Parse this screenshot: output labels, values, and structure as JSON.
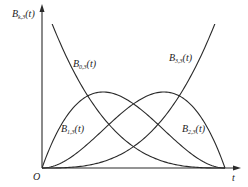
{
  "chart_data": {
    "type": "line",
    "title": "",
    "xlabel": "t",
    "ylabel": "B_{k,3}(t)",
    "origin_label": "O",
    "xlim": [
      0,
      1
    ],
    "ylim": [
      0,
      1
    ],
    "grid": false,
    "legend": "inline labels",
    "series": [
      {
        "name": "B_{0,3}(t)",
        "formula": "(1-t)^3",
        "x": [
          0,
          0.25,
          0.5,
          0.75,
          1
        ],
        "values": [
          1,
          0.422,
          0.125,
          0.016,
          0
        ]
      },
      {
        "name": "B_{1,3}(t)",
        "formula": "3t(1-t)^2",
        "x": [
          0,
          0.25,
          0.333,
          0.5,
          0.75,
          1
        ],
        "values": [
          0,
          0.422,
          0.444,
          0.375,
          0.141,
          0
        ]
      },
      {
        "name": "B_{2,3}(t)",
        "formula": "3t^2(1-t)",
        "x": [
          0,
          0.25,
          0.5,
          0.667,
          0.75,
          1
        ],
        "values": [
          0,
          0.141,
          0.375,
          0.444,
          0.422,
          0
        ]
      },
      {
        "name": "B_{3,3}(t)",
        "formula": "t^3",
        "x": [
          0,
          0.25,
          0.5,
          0.75,
          1
        ],
        "values": [
          0,
          0.016,
          0.125,
          0.422,
          1
        ]
      }
    ]
  },
  "labels": {
    "y_axis": {
      "main": "B",
      "sub": "k,3",
      "arg": "(t)"
    },
    "x_axis": "t",
    "origin": "O",
    "b03": {
      "main": "B",
      "sub": "0,3",
      "arg": "(t)"
    },
    "b13": {
      "main": "B",
      "sub": "1,3",
      "arg": "(t)"
    },
    "b23": {
      "main": "B",
      "sub": "2,3",
      "arg": "(t)"
    },
    "b33": {
      "main": "B",
      "sub": "3,3",
      "arg": "(t)"
    }
  },
  "colors": {
    "line": "#2a2a2a",
    "axis": "#2a2a2a",
    "background": "#ffffff"
  }
}
